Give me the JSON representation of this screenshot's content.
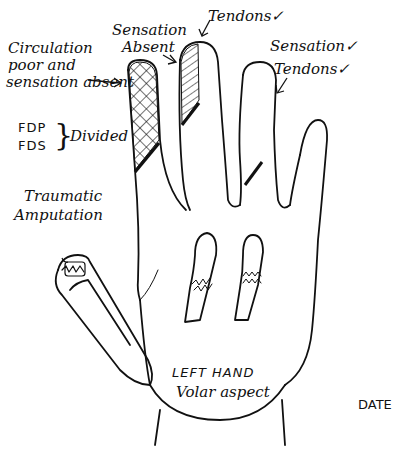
{
  "diagram": {
    "title": "LEFT HAND",
    "subtitle": "Volar aspect",
    "date_label": "DATE",
    "annotations": {
      "index_finger": {
        "text_line1": "Circulation",
        "text_line2": "poor and",
        "text_line3": "sensation absent",
        "pattern": "cross-hatch"
      },
      "middle_finger_tip": {
        "text_line1": "Sensation",
        "text_line2": "Absent",
        "pattern": "diagonal-hatch"
      },
      "middle_finger": {
        "text": "Tendons",
        "check": "✓"
      },
      "ring_finger_sensation": {
        "text": "Sensation",
        "check": "✓"
      },
      "ring_finger_tendons": {
        "text": "Tendons",
        "check": "✓"
      },
      "tendon_injury": {
        "left": "FDP",
        "right": "FDS",
        "bracket": "}",
        "status": "Divided"
      },
      "thumb": {
        "text_line1": "Traumatic",
        "text_line2": "Amputation"
      }
    }
  }
}
